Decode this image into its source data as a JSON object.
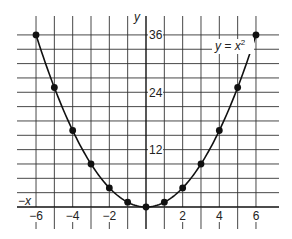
{
  "chart_data": {
    "type": "line",
    "title": "",
    "equation_label": "y = x²",
    "xlabel": "x",
    "xlabel_negative": "−x",
    "ylabel": "y",
    "xlim": [
      -6,
      6
    ],
    "ylim": [
      0,
      36
    ],
    "x_ticks": [
      -6,
      -4,
      -2,
      2,
      4,
      6
    ],
    "x_tick_labels": [
      "−6",
      "−4",
      "−2",
      "2",
      "4",
      "6"
    ],
    "y_ticks": [
      12,
      24,
      36
    ],
    "y_tick_labels": [
      "12",
      "24",
      "36"
    ],
    "grid": true,
    "grid_x_step": 1,
    "grid_y_step": 3,
    "series": [
      {
        "name": "y = x^2",
        "x": [
          -6,
          -5,
          -4,
          -3,
          -2,
          -1,
          0,
          1,
          2,
          3,
          4,
          5,
          6
        ],
        "y": [
          36,
          25,
          16,
          9,
          4,
          1,
          0,
          1,
          4,
          9,
          16,
          25,
          36
        ],
        "markers": true,
        "color": "#111111"
      }
    ]
  }
}
